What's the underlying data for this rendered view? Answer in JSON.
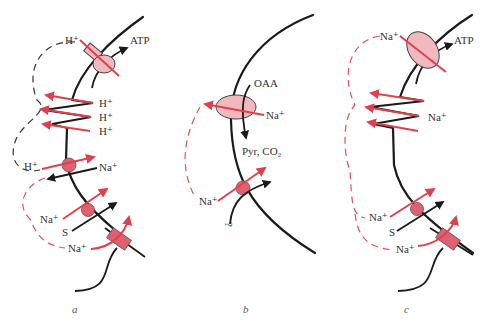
{
  "panels": [
    {
      "id": "a",
      "label": "a",
      "labels": {
        "h_top": "H⁺",
        "atp": "ATP",
        "h1": "H⁺",
        "h2": "H⁺",
        "h3": "H⁺",
        "h_left": "H⁺",
        "na_right": "Na⁺",
        "na_mid": "Na⁺",
        "s": "S",
        "na_bottom": "Na⁺"
      }
    },
    {
      "id": "b",
      "label": "b",
      "labels": {
        "oaa": "OAA",
        "na_right": "Na⁺",
        "pyr": "Pyr, CO₂",
        "na_left": "Na⁺",
        "q": "?"
      }
    },
    {
      "id": "c",
      "label": "c",
      "labels": {
        "na_top": "Na⁺",
        "atp": "ATP",
        "na_right": "Na⁺",
        "na_mid": "Na⁺",
        "s": "S",
        "na_bottom": "Na⁺"
      }
    }
  ],
  "colors": {
    "membrane": "#1a1a1a",
    "ion_flux": "#e0404e",
    "enzyme_fill": "#f2b8bf",
    "transporter_fill": "#e06070"
  }
}
